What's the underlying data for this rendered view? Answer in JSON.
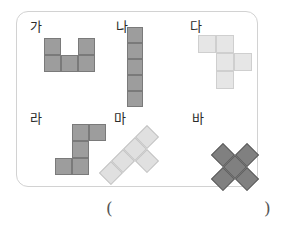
{
  "page": {
    "background_color": "#ffffff",
    "width": 290,
    "height": 237
  },
  "frame": {
    "border_color": "#d2d2d2",
    "radius": 12,
    "x": 16,
    "y": 11,
    "width": 242,
    "height": 176
  },
  "palette": {
    "medium_gray_fill": "#9d9d9d",
    "medium_gray_border": "#7a7a7a",
    "light_gray_fill": "#e6e6e6",
    "light_gray_border": "#c9c9c9",
    "pale_gray_fill": "#d9d9d9",
    "pale_gray_border": "#bdbdbd",
    "dark_gray_fill": "#808080",
    "dark_gray_border": "#5e5e5e",
    "label_color": "#2b2b2b",
    "paren_color": "#555555"
  },
  "shapes": [
    {
      "id": "ga",
      "label": "가",
      "label_x": 14,
      "label_y": 9,
      "poly_x": 28,
      "poly_y": 27,
      "cell": 17,
      "fill": "#9d9d9d",
      "border": "#7a7a7a",
      "rotated": false,
      "cells": [
        [
          0,
          0
        ],
        [
          2,
          0
        ],
        [
          0,
          1
        ],
        [
          1,
          1
        ],
        [
          2,
          1
        ]
      ],
      "description": "U-pentomino"
    },
    {
      "id": "na",
      "label": "나",
      "label_x": 100,
      "label_y": 9,
      "poly_x": 111,
      "poly_y": 16,
      "cell": 16,
      "fill": "#9d9d9d",
      "border": "#7a7a7a",
      "rotated": false,
      "cells": [
        [
          0,
          0
        ],
        [
          0,
          1
        ],
        [
          0,
          2
        ],
        [
          0,
          3
        ],
        [
          0,
          4
        ]
      ],
      "description": "I-pentomino vertical"
    },
    {
      "id": "da",
      "label": "다",
      "label_x": 174,
      "label_y": 9,
      "poly_x": 182,
      "poly_y": 24,
      "cell": 18,
      "fill": "#e6e6e6",
      "border": "#cfcfcf",
      "rotated": false,
      "cells": [
        [
          0,
          0
        ],
        [
          1,
          0
        ],
        [
          1,
          1
        ],
        [
          2,
          1
        ],
        [
          1,
          2
        ]
      ],
      "description": "F/N-pentomino light"
    },
    {
      "id": "ra",
      "label": "라",
      "label_x": 14,
      "label_y": 101,
      "poly_x": 39,
      "poly_y": 113,
      "cell": 17,
      "fill": "#9d9d9d",
      "border": "#7a7a7a",
      "rotated": false,
      "cells": [
        [
          1,
          0
        ],
        [
          2,
          0
        ],
        [
          1,
          1
        ],
        [
          0,
          2
        ],
        [
          1,
          2
        ]
      ],
      "description": "S/Z-pentomino"
    },
    {
      "id": "ma",
      "label": "마",
      "label_x": 98,
      "label_y": 101,
      "poly_x": 131,
      "poly_y": 114,
      "cell": 17,
      "fill": "#e0e0e0",
      "border": "#c4c4c4",
      "rotated": true,
      "cells": [
        [
          0,
          0
        ],
        [
          0,
          1
        ],
        [
          0,
          2
        ],
        [
          0,
          3
        ],
        [
          1,
          1
        ]
      ],
      "description": "Y-pentomino rotated 45 degrees"
    },
    {
      "id": "ba",
      "label": "바",
      "label_x": 176,
      "label_y": 101,
      "poly_x": 219,
      "poly_y": 120,
      "cell": 17,
      "fill": "#808080",
      "border": "#5e5e5e",
      "rotated": true,
      "cells": [
        [
          1,
          0
        ],
        [
          0,
          1
        ],
        [
          1,
          1
        ],
        [
          2,
          1
        ],
        [
          1,
          2
        ]
      ],
      "description": "X-pentomino (plus) rotated 45 degrees"
    }
  ],
  "answer": {
    "open_paren": "(",
    "close_paren": ")"
  }
}
